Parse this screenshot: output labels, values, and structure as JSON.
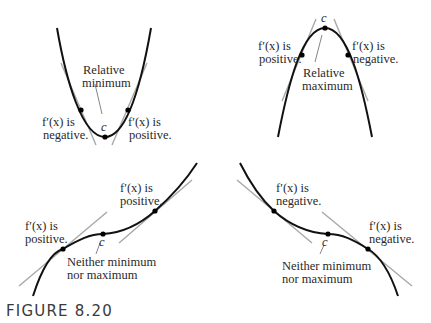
{
  "figure": {
    "caption": "FIGURE 8.20",
    "panels": [
      {
        "id": "relative-minimum",
        "title": "Relative minimum",
        "title_lines": [
          "Relative",
          "minimum"
        ],
        "point_label": "c",
        "left_label": [
          "f′(x) is",
          "negative."
        ],
        "right_label": [
          "f′(x) is",
          "positive."
        ]
      },
      {
        "id": "relative-maximum",
        "title": "Relative maximum",
        "title_lines": [
          "Relative",
          "maximum"
        ],
        "point_label": "c",
        "left_label": [
          "f′(x) is",
          "positive."
        ],
        "right_label": [
          "f′(x) is",
          "negative."
        ]
      },
      {
        "id": "increasing-inflection",
        "title": "Neither minimum nor maximum",
        "title_lines": [
          "Neither minimum",
          "nor maximum"
        ],
        "point_label": "c",
        "left_label": [
          "f′(x) is",
          "positive."
        ],
        "right_label": [
          "f′(x) is",
          "positive."
        ]
      },
      {
        "id": "decreasing-inflection",
        "title": "Neither minimum nor maximum",
        "title_lines": [
          "Neither minimum",
          "nor maximum"
        ],
        "point_label": "c",
        "left_label": [
          "f′(x) is",
          "negative."
        ],
        "right_label": [
          "f′(x) is",
          "negative."
        ]
      }
    ]
  },
  "colors": {
    "curve": "#111111",
    "tangent": "#a8a8a8",
    "text": "#2a2a2a"
  }
}
